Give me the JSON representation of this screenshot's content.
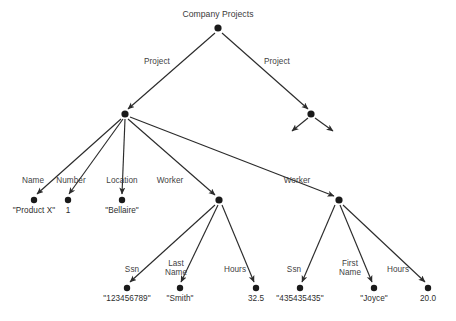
{
  "diagram": {
    "type": "object-tree",
    "title": "Company Projects",
    "root": {
      "id": "root",
      "label": "Company Projects",
      "x": 218,
      "y": 28
    },
    "nodes": [
      {
        "id": "project1",
        "label": "",
        "x": 125,
        "y": 114
      },
      {
        "id": "project2",
        "label": "",
        "x": 311,
        "y": 114
      },
      {
        "id": "worker1",
        "label": "",
        "x": 219,
        "y": 200
      },
      {
        "id": "worker2",
        "label": "",
        "x": 339,
        "y": 200
      }
    ],
    "leaves": [
      {
        "id": "name-val",
        "value": "\"Product X\"",
        "x": 34,
        "y": 200,
        "label_x": 34,
        "label_y": 206
      },
      {
        "id": "number-val",
        "value": "1",
        "x": 68,
        "y": 200,
        "label_x": 68,
        "label_y": 206
      },
      {
        "id": "location-val",
        "value": "\"Bellaire\"",
        "x": 122,
        "y": 200,
        "label_x": 122,
        "label_y": 206
      },
      {
        "id": "ssn1-val",
        "value": "\"123456789\"",
        "x": 127,
        "y": 288,
        "label_x": 127,
        "label_y": 294
      },
      {
        "id": "lastname-val",
        "value": "\"Smith\"",
        "x": 180,
        "y": 288,
        "label_x": 180,
        "label_y": 294
      },
      {
        "id": "hours1-val",
        "value": "32.5",
        "x": 256,
        "y": 288,
        "label_x": 256,
        "label_y": 294
      },
      {
        "id": "ssn2-val",
        "value": "\"435435435\"",
        "x": 300,
        "y": 288,
        "label_x": 300,
        "label_y": 294
      },
      {
        "id": "firstname-val",
        "value": "\"Joyce\"",
        "x": 374,
        "y": 288,
        "label_x": 374,
        "label_y": 294
      },
      {
        "id": "hours2-val",
        "value": "20.0",
        "x": 428,
        "y": 288,
        "label_x": 428,
        "label_y": 294
      }
    ],
    "edge_labels": [
      {
        "id": "edge-project-left",
        "text": "Project",
        "x": 157,
        "y": 57
      },
      {
        "id": "edge-project-right",
        "text": "Project",
        "x": 277,
        "y": 57
      },
      {
        "id": "edge-name",
        "text": "Name",
        "x": 33,
        "y": 176
      },
      {
        "id": "edge-number",
        "text": "Number",
        "x": 71,
        "y": 176
      },
      {
        "id": "edge-location",
        "text": "Location",
        "x": 122,
        "y": 176
      },
      {
        "id": "edge-worker-left",
        "text": "Worker",
        "x": 170,
        "y": 176
      },
      {
        "id": "edge-worker-right",
        "text": "Worker",
        "x": 297,
        "y": 176
      },
      {
        "id": "edge-ssn-left",
        "text": "Ssn",
        "x": 132,
        "y": 265
      },
      {
        "id": "edge-lastname",
        "text": "Last\nName",
        "x": 176,
        "y": 259
      },
      {
        "id": "edge-hours-left",
        "text": "Hours",
        "x": 235,
        "y": 265
      },
      {
        "id": "edge-ssn-right",
        "text": "Ssn",
        "x": 294,
        "y": 265
      },
      {
        "id": "edge-firstname",
        "text": "First\nName",
        "x": 350,
        "y": 259
      },
      {
        "id": "edge-hours-right",
        "text": "Hours",
        "x": 398,
        "y": 265
      }
    ],
    "edges": [
      {
        "id": "root-to-project1",
        "from": "root",
        "to": "project1",
        "x1": 215,
        "y1": 33,
        "x2": 128,
        "y2": 109,
        "label": "Project"
      },
      {
        "id": "root-to-project2",
        "from": "root",
        "to": "project2",
        "x1": 222,
        "y1": 33,
        "x2": 308,
        "y2": 109,
        "label": "Project"
      },
      {
        "id": "project2-dangle-left",
        "from": "project2",
        "to": "",
        "x1": 308,
        "y1": 118,
        "x2": 292,
        "y2": 131,
        "label": ""
      },
      {
        "id": "project2-dangle-right",
        "from": "project2",
        "to": "",
        "x1": 315,
        "y1": 118,
        "x2": 333,
        "y2": 131,
        "label": ""
      },
      {
        "id": "project1-to-name",
        "from": "project1",
        "to": "name-val",
        "x1": 121,
        "y1": 119,
        "x2": 37,
        "y2": 194,
        "label": "Name"
      },
      {
        "id": "project1-to-number",
        "from": "project1",
        "to": "number-val",
        "x1": 123,
        "y1": 119,
        "x2": 69,
        "y2": 194,
        "label": "Number"
      },
      {
        "id": "project1-to-location",
        "from": "project1",
        "to": "location-val",
        "x1": 125,
        "y1": 119,
        "x2": 122,
        "y2": 194,
        "label": "Location"
      },
      {
        "id": "project1-to-worker1",
        "from": "project1",
        "to": "worker1",
        "x1": 128,
        "y1": 119,
        "x2": 215,
        "y2": 195,
        "label": "Worker"
      },
      {
        "id": "project1-to-worker2",
        "from": "project1",
        "to": "worker2",
        "x1": 130,
        "y1": 117,
        "x2": 334,
        "y2": 196,
        "label": "Worker"
      },
      {
        "id": "worker1-to-ssn",
        "from": "worker1",
        "to": "ssn1-val",
        "x1": 215,
        "y1": 205,
        "x2": 130,
        "y2": 282,
        "label": "Ssn"
      },
      {
        "id": "worker1-to-lastname",
        "from": "worker1",
        "to": "lastname-val",
        "x1": 218,
        "y1": 205,
        "x2": 181,
        "y2": 282,
        "label": "Last Name"
      },
      {
        "id": "worker1-to-hours",
        "from": "worker1",
        "to": "hours1-val",
        "x1": 222,
        "y1": 205,
        "x2": 254,
        "y2": 282,
        "label": "Hours"
      },
      {
        "id": "worker2-to-ssn",
        "from": "worker2",
        "to": "ssn2-val",
        "x1": 335,
        "y1": 205,
        "x2": 302,
        "y2": 282,
        "label": "Ssn"
      },
      {
        "id": "worker2-to-firstname",
        "from": "worker2",
        "to": "firstname-val",
        "x1": 340,
        "y1": 205,
        "x2": 372,
        "y2": 282,
        "label": "First Name"
      },
      {
        "id": "worker2-to-hours",
        "from": "worker2",
        "to": "hours2-val",
        "x1": 343,
        "y1": 205,
        "x2": 425,
        "y2": 282,
        "label": "Hours"
      }
    ],
    "colors": {
      "background": "#ffffff",
      "node": "#1a1a1a",
      "edge": "#2b2b2b",
      "text": "#3a3a3a"
    }
  }
}
